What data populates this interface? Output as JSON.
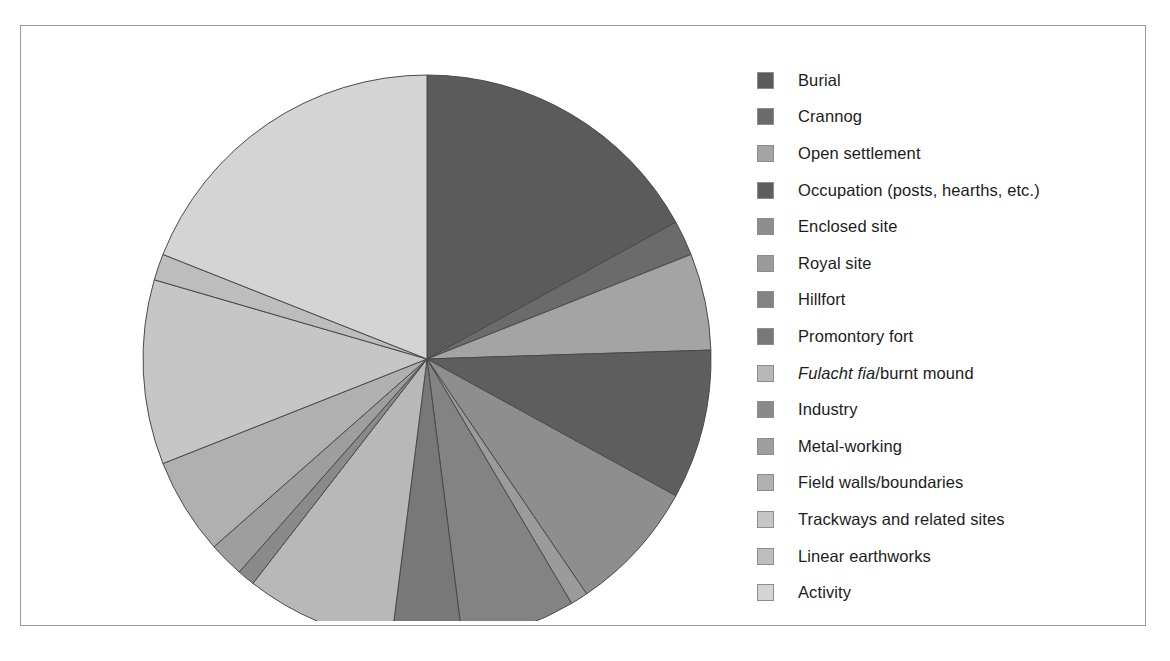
{
  "figure": {
    "background_color": "#ffffff",
    "frame_color": "#9a9a9a"
  },
  "legend": {
    "position": "right",
    "items": [
      {
        "label": "Burial",
        "color": "#5b5b5b"
      },
      {
        "label": "Crannog",
        "color": "#6b6b6b"
      },
      {
        "label": "Open settlement",
        "color": "#a4a4a4"
      },
      {
        "label": "Occupation (posts, hearths, etc.)",
        "color": "#5e5e5e"
      },
      {
        "label": "Enclosed site",
        "color": "#8e8e8e"
      },
      {
        "label": "Royal site",
        "color": "#9b9b9b"
      },
      {
        "label": "Hillfort",
        "color": "#838383"
      },
      {
        "label": "Promontory fort",
        "color": "#787878"
      },
      {
        "label": "Fulacht fia/burnt mound",
        "label_italic_prefix": "Fulacht fia",
        "label_rest": "/burnt mound",
        "color": "#b8b8b8"
      },
      {
        "label": "Industry",
        "color": "#8a8a8a"
      },
      {
        "label": "Metal-working",
        "color": "#9e9e9e"
      },
      {
        "label": "Field walls/boundaries",
        "color": "#b0b0b0"
      },
      {
        "label": "Trackways and related sites",
        "color": "#c6c6c6"
      },
      {
        "label": "Linear earthworks",
        "color": "#bdbdbd"
      },
      {
        "label": "Activity",
        "color": "#d4d4d4"
      }
    ]
  },
  "chart_data": {
    "type": "pie",
    "title": "",
    "start_angle_deg": 0,
    "direction": "clockwise",
    "center": {
      "x": 306,
      "y": 310
    },
    "radius": 284,
    "stroke_color": "#4a4a4a",
    "labels": [
      "Burial",
      "Crannog",
      "Open settlement",
      "Occupation (posts, hearths, etc.)",
      "Enclosed site",
      "Royal site",
      "Hillfort",
      "Promontory fort",
      "Fulacht fia/burnt mound",
      "Industry",
      "Metal-working",
      "Field walls/boundaries",
      "Trackways and related sites",
      "Linear earthworks",
      "Activity"
    ],
    "values": [
      17.0,
      2.0,
      5.5,
      8.5,
      7.5,
      1.0,
      6.5,
      4.0,
      8.5,
      1.0,
      2.0,
      5.5,
      10.5,
      1.5,
      19.0
    ],
    "unit": "percent",
    "colors": [
      "#5b5b5b",
      "#6b6b6b",
      "#a4a4a4",
      "#5e5e5e",
      "#8e8e8e",
      "#9b9b9b",
      "#838383",
      "#787878",
      "#b8b8b8",
      "#8a8a8a",
      "#9e9e9e",
      "#b0b0b0",
      "#c6c6c6",
      "#bdbdbd",
      "#d4d4d4"
    ],
    "legend_position": "right",
    "grid": false
  }
}
